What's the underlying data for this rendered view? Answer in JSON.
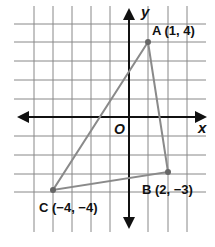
{
  "diagram": {
    "type": "coordinate-plane-triangle",
    "axes": {
      "x_label": "x",
      "y_label": "y",
      "origin_label": "O"
    },
    "grid": {
      "x_range": [
        -5,
        3
      ],
      "y_range": [
        -4,
        5
      ]
    },
    "points": [
      {
        "name": "A",
        "x": 1,
        "y": 4,
        "label": "A (1, 4)"
      },
      {
        "name": "B",
        "x": 2,
        "y": -3,
        "label": "B (2, −3)"
      },
      {
        "name": "C",
        "x": -4,
        "y": -4,
        "label": "C (−4, −4)"
      }
    ],
    "colors": {
      "grid": "#777777",
      "axis": "#111111",
      "triangle": "#8a8a8a"
    }
  }
}
